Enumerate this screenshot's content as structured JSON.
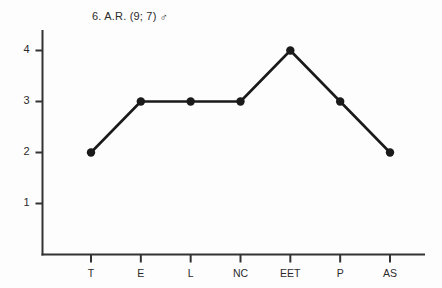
{
  "chart_data": {
    "type": "line",
    "title": "6. A.R. (9; 7)",
    "title_glyph": "male-symbol-rotated",
    "title_glyph_char": "♂",
    "xlabel": "",
    "ylabel": "",
    "categories": [
      "T",
      "E",
      "L",
      "NC",
      "EET",
      "P",
      "AS"
    ],
    "values": [
      2,
      3,
      3,
      3,
      4,
      3,
      2
    ],
    "series": [
      {
        "name": "A.R.",
        "values": [
          2,
          3,
          3,
          3,
          4,
          3,
          2
        ]
      }
    ],
    "ylim": [
      0,
      4.6
    ],
    "y_ticks": [
      1,
      2,
      3,
      4
    ],
    "y_tick_labels": [
      "1",
      "2",
      "3",
      "4"
    ],
    "grid": false,
    "legend": false,
    "legend_position": "none",
    "marker": "filled-circle",
    "line_color": "#1a1a1a",
    "marker_color": "#1a1a1a",
    "axis_color": "#333333",
    "background": "#fdfdfd"
  },
  "axes": {
    "y_axis_name": "value-axis",
    "x_axis_name": "category-axis"
  }
}
